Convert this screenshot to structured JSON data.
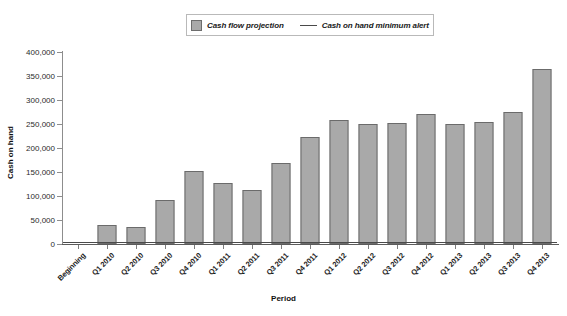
{
  "legend": {
    "position": "top-center",
    "entries": [
      {
        "label": "Cash flow projection",
        "marker": "bar-swatch-icon",
        "color": "#a9a9a9"
      },
      {
        "label": "Cash on hand minimum alert",
        "marker": "line-swatch-icon",
        "color": "#4a4a4a"
      }
    ]
  },
  "axes": {
    "y_title": "Cash on hand",
    "x_title": "Period",
    "y_ticks": [
      "0",
      "50,000",
      "100,000",
      "150,000",
      "200,000",
      "250,000",
      "300,000",
      "350,000",
      "400,000"
    ]
  },
  "chart_data": {
    "type": "bar",
    "title": "",
    "subtitle": "",
    "xlabel": "Period",
    "ylabel": "Cash on hand",
    "grid": false,
    "legend_position": "top-center",
    "ylim": [
      0,
      400000
    ],
    "ytick_values": [
      0,
      50000,
      100000,
      150000,
      200000,
      250000,
      300000,
      350000,
      400000
    ],
    "categories": [
      "Beginning",
      "Q1 2010",
      "Q2 2010",
      "Q3 2010",
      "Q4 2010",
      "Q1 2011",
      "Q2 2011",
      "Q3 2011",
      "Q4 2011",
      "Q1 2012",
      "Q2 2012",
      "Q3 2012",
      "Q4 2012",
      "Q1 2013",
      "Q2 2013",
      "Q3 2013",
      "Q4 2013"
    ],
    "series": [
      {
        "name": "Cash flow projection",
        "type": "bar",
        "color": "#a9a9a9",
        "values": [
          0,
          40000,
          35000,
          92000,
          152000,
          127000,
          113000,
          169000,
          222000,
          258000,
          250000,
          252000,
          270000,
          251000,
          255000,
          275000,
          365000
        ]
      },
      {
        "name": "Cash on hand minimum alert",
        "type": "line",
        "color": "#4a4a4a",
        "constant_value": 5000
      }
    ]
  }
}
